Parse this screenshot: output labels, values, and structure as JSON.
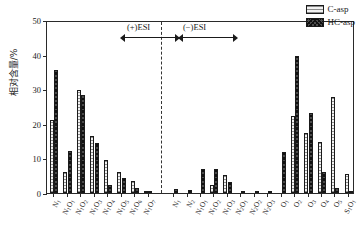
{
  "figure": {
    "background": "#ffffff",
    "frame_color": "#2a2a2a"
  },
  "axes": {
    "y_axis_label": "相对含量/%",
    "y_ticks": [
      "0",
      "10",
      "20",
      "30",
      "40",
      "50"
    ],
    "y_min": 0,
    "y_max": 50
  },
  "annotations": {
    "positive_mode": "(+)ESI",
    "negative_mode": "(−)ESI"
  },
  "legend": {
    "entries": [
      {
        "label": "C-asp",
        "pattern": "horizontal-hatch",
        "color": "#f2f2f2"
      },
      {
        "label": "HC-asp",
        "pattern": "cross-hatch",
        "color": "#4a4a4a"
      }
    ]
  },
  "chart_data": {
    "type": "bar",
    "title": "",
    "xlabel": "",
    "ylabel": "相对含量/%",
    "ylim": [
      0,
      50
    ],
    "grid": false,
    "legend_position": "top-right",
    "categories": [
      "N1",
      "N1O1",
      "N1O2",
      "N1O3",
      "N1O4",
      "N1O5",
      "N1O6",
      "N1O7",
      "N2",
      "N2O1",
      "N2O2",
      "N2O3",
      "N2O4",
      "N2O5",
      "N2O6",
      "N2O7",
      "O1",
      "O2",
      "O3",
      "O4",
      "O5",
      "S1O1"
    ],
    "category_labels_html": [
      "N<sub>1</sub>",
      "N<sub>1</sub>O<sub>1</sub>",
      "N<sub>1</sub>O<sub>2</sub>",
      "N<sub>1</sub>O<sub>3</sub>",
      "N<sub>1</sub>O<sub>4</sub>",
      "N<sub>1</sub>O<sub>5</sub>",
      "N<sub>1</sub>O<sub>6</sub>",
      "N<sub>1</sub>O<sub>7</sub>",
      "N<sub>1</sub>",
      "N<sub>2</sub>",
      "N<sub>1</sub>O<sub>1</sub>",
      "N<sub>1</sub>O<sub>2</sub>",
      "N<sub>1</sub>O<sub>3</sub>",
      "N<sub>2</sub>O<sub>1</sub>",
      "N<sub>2</sub>O<sub>2</sub>",
      "N<sub>2</sub>O<sub>3</sub>",
      "O<sub>1</sub>",
      "O<sub>2</sub>",
      "O<sub>3</sub>",
      "O<sub>4</sub>",
      "O<sub>5</sub>",
      "S<sub>1</sub>O<sub>1</sub>"
    ],
    "series": [
      {
        "name": "C-asp",
        "values": [
          21.0,
          6.2,
          29.8,
          16.5,
          9.4,
          6.1,
          3.5,
          0.7,
          0.0,
          0.0,
          0.0,
          2.3,
          5.3,
          0.0,
          0.0,
          0.0,
          0.0,
          22.3,
          17.3,
          14.6,
          27.8,
          5.4
        ]
      },
      {
        "name": "HC-asp",
        "values": [
          35.5,
          12.1,
          28.2,
          14.4,
          2.4,
          4.2,
          1.5,
          0.4,
          1.1,
          0.8,
          7.0,
          7.0,
          3.1,
          0.6,
          0.5,
          0.5,
          11.8,
          39.5,
          23.2,
          6.2,
          1.4,
          0.6
        ]
      }
    ],
    "mode_split": {
      "positive_esi_categories": 8,
      "negative_esi_categories": 14
    }
  }
}
